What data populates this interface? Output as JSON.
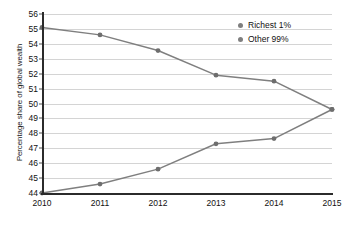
{
  "chart_data": {
    "type": "line",
    "title": "",
    "xlabel": "",
    "ylabel": "Percentage share of global wealth",
    "x": [
      2010,
      2011,
      2012,
      2013,
      2014,
      2015
    ],
    "xtick_labels": [
      "2010",
      "2011",
      "2012",
      "2013",
      "2014",
      "2015"
    ],
    "ytick_labels": [
      "44",
      "45",
      "46",
      "47",
      "48",
      "49",
      "50",
      "51",
      "52",
      "53",
      "54",
      "55",
      "56"
    ],
    "yticks": [
      44,
      45,
      46,
      47,
      48,
      49,
      50,
      51,
      52,
      53,
      54,
      55,
      56
    ],
    "ylim": [
      44,
      56
    ],
    "xlim": [
      2010,
      2015
    ],
    "grid": true,
    "legend_position": "top-right",
    "series": [
      {
        "name": "Richest 1%",
        "color": "#7f7f7f",
        "values": [
          55.1,
          54.6,
          53.55,
          51.9,
          51.5,
          49.6
        ]
      },
      {
        "name": "Other 99%",
        "color": "#7f7f7f",
        "values": [
          44.0,
          44.6,
          45.6,
          47.3,
          47.65,
          49.6
        ]
      }
    ]
  },
  "legend": {
    "items": [
      {
        "label": "Richest 1%",
        "color": "#7f7f7f"
      },
      {
        "label": "Other 99%",
        "color": "#7f7f7f"
      }
    ]
  },
  "colors": {
    "line": "#7f7f7f",
    "marker": "#6e6e6e",
    "axis": "#2b2b2b",
    "grid": "#d4d4d4",
    "text": "#111111",
    "background": "#ffffff"
  }
}
